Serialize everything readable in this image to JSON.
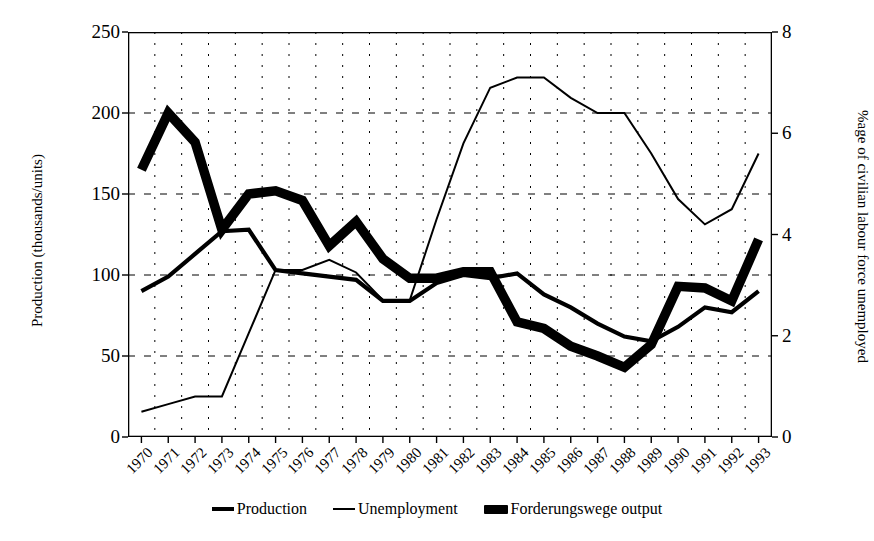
{
  "chart_data": {
    "type": "line",
    "title": "",
    "xlabel": "",
    "ylabel": "Production (thousands/units)",
    "y2label": "%age of civilian labour force unemployed",
    "ylim": [
      0,
      250
    ],
    "y2lim": [
      0,
      8
    ],
    "yticks": [
      0,
      50,
      100,
      150,
      200,
      250
    ],
    "y2ticks": [
      0,
      2,
      4,
      6,
      8
    ],
    "grid": true,
    "legend_position": "bottom",
    "categories": [
      "1970",
      "1971",
      "1972",
      "1973",
      "1974",
      "1975",
      "1976",
      "1977",
      "1978",
      "1979",
      "1980",
      "1981",
      "1982",
      "1983",
      "1984",
      "1985",
      "1986",
      "1987",
      "1988",
      "1989",
      "1990",
      "1991",
      "1992",
      "1993"
    ],
    "series": [
      {
        "name": "Production",
        "axis": "left",
        "values": [
          90,
          99,
          113,
          127,
          128,
          103,
          101,
          99,
          97,
          84,
          84,
          95,
          100,
          98,
          101,
          88,
          80,
          70,
          62,
          59,
          68,
          80,
          77,
          90
        ]
      },
      {
        "name": "Unemployment",
        "axis": "right",
        "unit": "%",
        "values": [
          0.5,
          0.65,
          0.8,
          0.8,
          2.05,
          3.3,
          3.3,
          3.5,
          3.25,
          2.7,
          2.7,
          4.3,
          5.8,
          6.9,
          7.1,
          7.1,
          6.7,
          6.4,
          6.4,
          5.6,
          4.7,
          4.2,
          4.5,
          5.6
        ]
      },
      {
        "name": "Forderungswege output",
        "axis": "left",
        "values": [
          165,
          200,
          182,
          128,
          150,
          152,
          146,
          118,
          133,
          110,
          98,
          98,
          102,
          102,
          71,
          67,
          56,
          50,
          43,
          57,
          93,
          92,
          84,
          122
        ]
      }
    ],
    "legend": [
      "Production",
      "Unemployment",
      "Forderungswege output"
    ],
    "colors": {
      "production": "#000000",
      "unemployment": "#000000",
      "forderungswege": "#000000",
      "grid": "#000000",
      "axis": "#000000",
      "background": "#ffffff"
    },
    "line_widths": {
      "production": 4.2,
      "unemployment": 2.0,
      "forderungswege": 9.5
    }
  }
}
